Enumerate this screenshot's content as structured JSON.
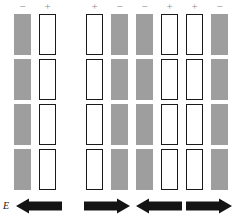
{
  "figure": {
    "field_label": "E",
    "colors": {
      "gray_fill": "#9e9e9e",
      "white_fill": "#ffffff",
      "outline": "#1a1a1a",
      "sign_color": "#8d8d8d",
      "arrow_color": "#141414",
      "background": "#ffffff"
    },
    "row_count": 4,
    "groups": [
      {
        "id": "left-group",
        "x": 14,
        "signs": [
          "−",
          "+"
        ],
        "bars": [
          "gray",
          "white"
        ],
        "bar_width": 17,
        "bar_gap": 8,
        "arrows": [
          {
            "direction": "left",
            "x": 16,
            "width": 46
          }
        ]
      },
      {
        "id": "middle-group",
        "x": 86,
        "signs": [
          "+",
          "−",
          "−",
          "+"
        ],
        "bars": [
          "white",
          "gray",
          "gray",
          "white"
        ],
        "bar_width": 17,
        "bar_gap": 8,
        "arrows": [
          {
            "direction": "right",
            "x": 84,
            "width": 46
          },
          {
            "direction": "left",
            "x": 136,
            "width": 46
          }
        ]
      },
      {
        "id": "right-group",
        "x": 186,
        "signs": [
          "+",
          "−"
        ],
        "bars": [
          "white",
          "gray"
        ],
        "bar_width": 17,
        "bar_gap": 8,
        "arrows": [
          {
            "direction": "right",
            "x": 186,
            "width": 46
          }
        ]
      }
    ]
  }
}
